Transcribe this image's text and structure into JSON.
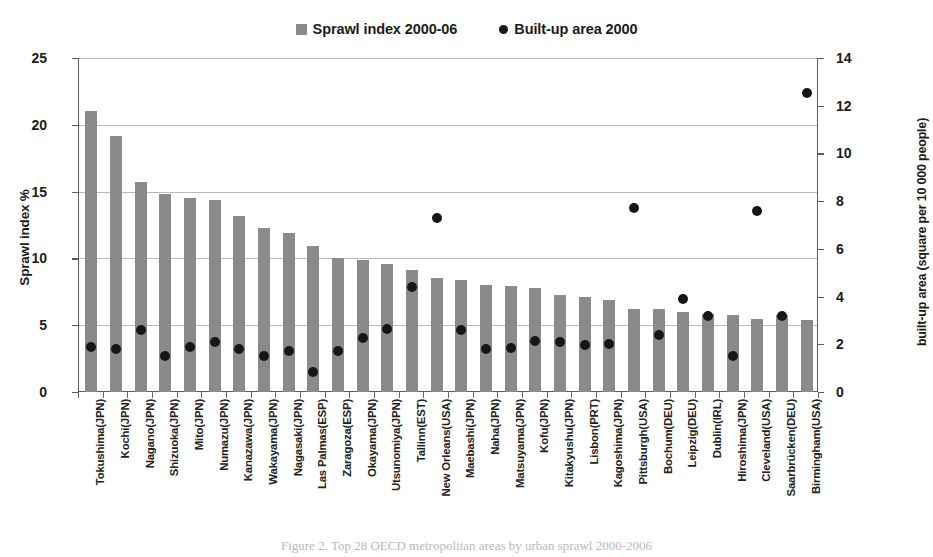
{
  "legend": {
    "items": [
      {
        "label": "Sprawl index 2000-06",
        "marker": "bar-swatch-icon",
        "color": "#8a8a8a"
      },
      {
        "label": "Built-up area 2000",
        "marker": "dot-swatch-icon",
        "color": "#1a1a1a"
      }
    ]
  },
  "axes": {
    "left_title": "Sprawl index %",
    "right_title": "built-up area (square per 10 000 people)",
    "left_ticks": [
      "0",
      "5",
      "10",
      "15",
      "20",
      "25"
    ],
    "right_ticks": [
      "0",
      "2",
      "4",
      "6",
      "8",
      "10",
      "12",
      "14"
    ]
  },
  "caption": "Figure 2. Top 28 OECD metropolitan areas by urban sprawl 2000-2006",
  "chart_data": {
    "type": "bar",
    "title": "",
    "xlabel": "",
    "ylabel": "Sprawl index %",
    "ylim": [
      0,
      25
    ],
    "y2label": "built-up area (square per 10 000 people)",
    "y2lim": [
      0,
      14
    ],
    "grid": true,
    "legend_position": "top-center",
    "categories": [
      "Tokushima(JPN)",
      "Kochi(JPN)",
      "Nagano(JPN)",
      "Shizuoka(JPN)",
      "Mito(JPN)",
      "Numazu(JPN)",
      "Kanazawa(JPN)",
      "Wakayama(JPN)",
      "Nagasaki(JPN)",
      "Las Palmas(ESP)",
      "Zaragoza(ESP)",
      "Okayama(JPN)",
      "Utsunomiya(JPN)",
      "Tallinn(EST)",
      "New Orleans(USA)",
      "Maebashi(JPN)",
      "Naha(JPN)",
      "Matsuyama(JPN)",
      "Kofu(JPN)",
      "Kitakyushu(JPN)",
      "Lisbon(PRT)",
      "Kagoshima(JPN)",
      "Pittsburgh(USA)",
      "Bochum(DEU)",
      "Leipzig(DEU)",
      "Dublin(IRL)",
      "Hiroshima(JPN)",
      "Cleveland(USA)",
      "Saarbrücken(DEU)",
      "Birmingham(USA)"
    ],
    "series": [
      {
        "name": "Sprawl index 2000-06",
        "axis": "left",
        "type": "bar",
        "color": "#8a8a8a",
        "values": [
          21.0,
          19.2,
          15.7,
          14.85,
          14.5,
          14.35,
          13.2,
          12.25,
          11.9,
          10.9,
          10.0,
          9.85,
          9.6,
          9.1,
          8.5,
          8.4,
          8.0,
          7.9,
          7.8,
          7.25,
          7.1,
          6.9,
          6.25,
          6.2,
          6.0,
          5.85,
          5.8,
          5.5,
          5.8,
          5.4
        ]
      },
      {
        "name": "Built-up area 2000",
        "axis": "right",
        "type": "scatter",
        "color": "#161616",
        "values": [
          1.9,
          1.8,
          2.6,
          1.5,
          1.9,
          2.1,
          1.8,
          1.5,
          1.7,
          0.85,
          1.7,
          2.25,
          2.65,
          4.4,
          7.3,
          2.6,
          1.8,
          1.85,
          2.15,
          2.1,
          1.95,
          2.0,
          7.7,
          2.4,
          3.9,
          3.2,
          1.5,
          7.6,
          3.2,
          12.55
        ]
      }
    ]
  }
}
